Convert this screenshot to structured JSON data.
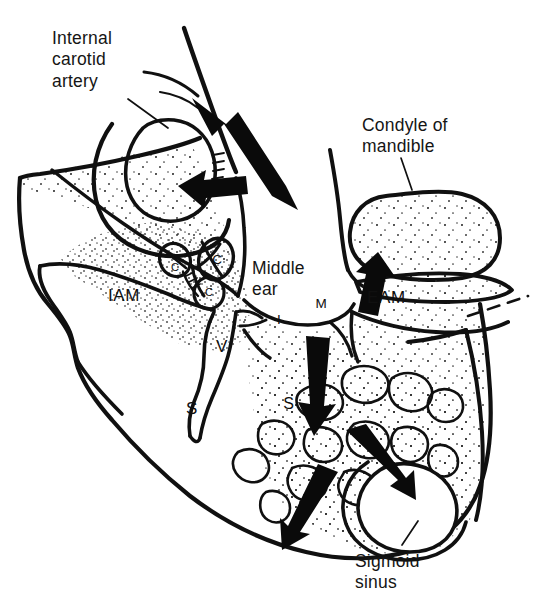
{
  "figure": {
    "kind": "anatomical-line-drawing",
    "background_color": "#ffffff",
    "ink_color": "#101010",
    "stipple_color": "#2a2a2a"
  },
  "annotations": [
    {
      "id": "internal-carotid-artery",
      "text": "Internal\ncarotid\nartery",
      "x": 52,
      "y": 28,
      "leader": true
    },
    {
      "id": "condyle-of-mandible",
      "text": "Condyle of\nmandible",
      "x": 362,
      "y": 115,
      "leader": true
    },
    {
      "id": "middle-ear",
      "text": "Middle\near",
      "x": 252,
      "y": 258,
      "leader": false
    },
    {
      "id": "sigmoid-sinus",
      "text": "Sigmoid\nsinus",
      "x": 355,
      "y": 551,
      "leader": true
    }
  ],
  "acronyms": [
    {
      "id": "iam",
      "text": "IAM",
      "x": 108,
      "y": 286,
      "meaning": "internal acoustic meatus"
    },
    {
      "id": "eam",
      "text": "EAM",
      "x": 367,
      "y": 288,
      "meaning": "external acoustic meatus"
    }
  ],
  "structure_markers": [
    {
      "id": "canal-c-upper-left",
      "letter": "C",
      "cx": 175,
      "cy": 260,
      "rx": 14,
      "ry": 16,
      "rot": -28,
      "size": "small"
    },
    {
      "id": "canal-c-upper-right",
      "letter": "C",
      "cx": 216,
      "cy": 259,
      "rx": 16,
      "ry": 19,
      "rot": 16,
      "size": "normal"
    },
    {
      "id": "canal-c-lower",
      "letter": "C",
      "cx": 209,
      "cy": 292,
      "rx": 14,
      "ry": 15,
      "rot": 10,
      "size": "small"
    },
    {
      "id": "ossicle-incus",
      "letter": "I",
      "cx": 278,
      "cy": 319,
      "rx": 11,
      "ry": 11,
      "rot": 0,
      "size": "normal"
    },
    {
      "id": "ossicle-malleus",
      "letter": "M",
      "cx": 321,
      "cy": 303,
      "rx": 15,
      "ry": 13,
      "rot": 0,
      "size": "normal"
    },
    {
      "id": "sinus-marker-s",
      "letter": "S",
      "cx": 288,
      "cy": 403,
      "rx": 17,
      "ry": 17,
      "rot": 0,
      "size": "normal"
    }
  ],
  "free_letters": [
    {
      "id": "vestibule-v",
      "letter": "V",
      "x": 216,
      "y": 337
    },
    {
      "id": "stylomastoid-s",
      "letter": "S",
      "x": 186,
      "y": 399
    }
  ],
  "arrows": [
    {
      "id": "arrow-carotid-canal-up",
      "direction": "up-left",
      "note": "spread along carotid canal"
    },
    {
      "id": "arrow-carotid-canal-left",
      "direction": "left",
      "note": "spread into carotid sheath"
    },
    {
      "id": "arrow-eam-up",
      "direction": "up",
      "note": "spread to external acoustic meatus"
    },
    {
      "id": "arrow-mastoid-down",
      "direction": "down",
      "note": "spread into mastoid air cells"
    },
    {
      "id": "arrow-sigmoid-from-left",
      "direction": "down-right",
      "note": "spread to sigmoid sinus"
    },
    {
      "id": "arrow-sigmoid-from-right",
      "direction": "down-left",
      "note": "spread to sigmoid sinus"
    }
  ]
}
